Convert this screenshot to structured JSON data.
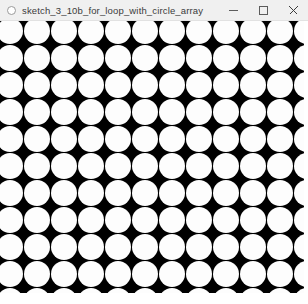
{
  "window": {
    "title": "sketch_3_10b_for_loop_with_circle_array",
    "app_icon": "processing-app-icon",
    "controls": {
      "minimize_label": "—",
      "maximize_label": "□",
      "close_label": "✕"
    },
    "titlebar_bg": "#f0f0f0",
    "title_color": "#3b3b3b"
  },
  "canvas": {
    "name": "sketch-canvas",
    "background_color": "#000000",
    "shape_color": "#fdfdfd",
    "shape": "circle",
    "grid": {
      "spacing_x": 27,
      "spacing_y": 27,
      "circle_diameter": 26,
      "offset_x": -3,
      "offset_y": -3,
      "columns": 12,
      "rows": 11
    },
    "width": 304,
    "height": 272
  }
}
